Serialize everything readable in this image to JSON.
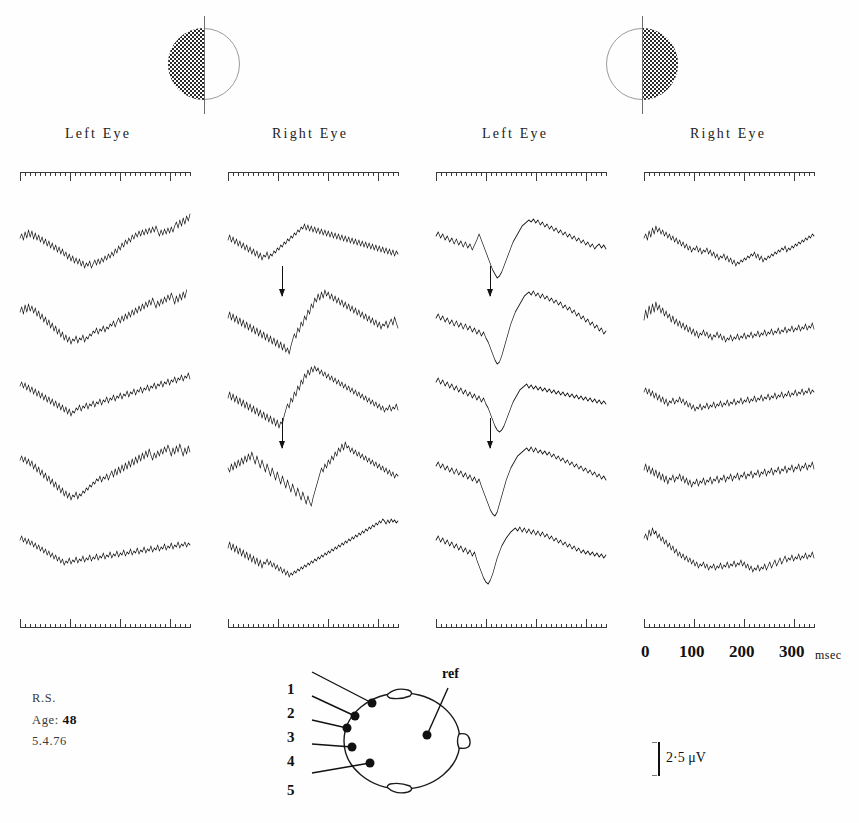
{
  "figure": {
    "subject": {
      "initials": "R.S.",
      "age_label": "Age:",
      "age_value": "48",
      "date": "5.4.76"
    },
    "calibration": {
      "label": "2·5 μV",
      "microvolts": 2.5
    },
    "time_axis": {
      "tick_labels": [
        "0",
        "100",
        "200",
        "300"
      ],
      "unit": "msec",
      "range_ms": [
        0,
        340
      ],
      "major_interval_ms": 100,
      "minor_interval_ms": 10
    },
    "stimuli": [
      {
        "name": "left-half-field-checkerboard",
        "shaded_half": "left"
      },
      {
        "name": "right-half-field-checkerboard",
        "shaded_half": "right"
      }
    ],
    "columns": [
      {
        "id": "c1",
        "label": "Left Eye",
        "stimulus": "left-half-field-checkerboard"
      },
      {
        "id": "c2",
        "label": "Right Eye",
        "stimulus": "left-half-field-checkerboard"
      },
      {
        "id": "c3",
        "label": "Left Eye",
        "stimulus": "right-half-field-checkerboard"
      },
      {
        "id": "c4",
        "label": "Right Eye",
        "stimulus": "right-half-field-checkerboard"
      }
    ],
    "electrodes": {
      "labels": [
        "1",
        "2",
        "3",
        "4",
        "5"
      ],
      "reference_label": "ref"
    }
  },
  "chart_data": {
    "type": "line",
    "xlabel": "msec",
    "ylabel": "μV",
    "xlim": [
      0,
      340
    ],
    "grid": false,
    "legend": "none",
    "n_columns": 4,
    "n_rows": 5,
    "row_electrodes": [
      "1",
      "2",
      "3",
      "4",
      "5"
    ],
    "annotations": [
      {
        "type": "arrow",
        "column": "c2",
        "row": 2,
        "points_to_ms": 108,
        "meaning": "major negative peak"
      },
      {
        "type": "arrow",
        "column": "c2",
        "row": 4,
        "points_to_ms": 108,
        "meaning": "major negative peak"
      },
      {
        "type": "arrow",
        "column": "c3",
        "row": 2,
        "points_to_ms": 108,
        "meaning": "major negative peak"
      },
      {
        "type": "arrow",
        "column": "c3",
        "row": 4,
        "points_to_ms": 108,
        "meaning": "major negative peak"
      }
    ],
    "series": [
      {
        "name": "c1-r1",
        "column": "c1",
        "row": 1,
        "d": "M0,24 L3,20 L6,26 L9,18 L12,24 L15,16 L18,23 L21,17 L24,25 L27,19 L30,26 L33,21 L36,28 L39,23 L42,30 L45,25 L48,32 L51,27 L54,34 L57,29 L60,36 L63,31 L66,38 L69,33 L72,40 L75,35 L78,42 L81,38 L84,45 L87,40 L90,47 L93,42 L96,49 L99,44 L102,50 L105,45 L108,52 L111,47 L114,54 L117,49 L120,52 L123,47 L126,54 L129,50 L132,46 L135,51 L138,45 L141,50 L144,44 L147,48 L150,42 L153,46 L156,40 L159,44 L162,38 L165,42 L168,35 L171,39 L174,32 L177,36 L180,29 L183,33 L186,26 L189,30 L192,24 L195,28 L198,21 L201,25 L204,19 L207,23 L210,17 L213,22 L216,16 L219,21 L222,15 L225,20 L228,14 L231,19 L234,13 L237,18 L240,12 L243,17 L246,22 L249,16 L252,21 L255,15 L258,20 L261,14 L264,19 L267,13 L270,18 L273,12 L276,8 L279,14 L282,6 L285,12 L288,4 L291,10 L294,2 L297,7 L300,0"
      },
      {
        "name": "c1-r2",
        "column": "c1",
        "row": 2,
        "d": "M0,22 L3,17 L6,24 L9,15 L12,22 L15,14 L18,21 L21,16 L24,23 L27,18 L30,26 L33,21 L36,29 L39,24 L42,32 L45,27 L48,35 L51,30 L54,38 L57,33 L60,41 L63,36 L66,44 L69,39 L72,47 L75,42 L78,50 L81,45 L84,52 L87,47 L90,54 L93,49 L96,51 L99,46 L102,53 L105,48 L108,50 L111,45 L114,52 L117,47 L120,49 L123,44 L126,46 L129,41 L132,43 L135,38 L138,44 L141,39 L144,41 L147,36 L150,42 L153,37 L156,39 L159,34 L162,36 L165,31 L168,37 L171,32 L174,28 L177,33 L180,26 L183,31 L186,24 L189,29 L192,22 L195,27 L198,20 L201,25 L204,18 L207,23 L210,16 L213,21 L216,14 L219,19 L222,12 L225,17 L228,10 L231,15 L234,8 L237,13 L240,18 L243,11 L246,16 L249,9 L252,14 L255,7 L258,12 L261,5 L264,10 L267,3 L270,8 L273,14 L276,6 L279,12 L282,4 L285,10 L288,2 L291,8 L294,0"
      },
      {
        "name": "c1-r3",
        "column": "c1",
        "row": 3,
        "d": "M0,20 L3,16 L6,22 L9,17 L12,24 L15,19 L18,26 L21,21 L24,28 L27,23 L30,30 L33,25 L36,32 L39,27 L42,34 L45,29 L48,36 L51,31 L54,38 L57,33 L60,40 L63,35 L66,42 L69,37 L72,44 L75,39 L78,46 L81,41 L84,48 L87,43 L90,50 L93,45 L96,47 L99,42 L102,44 L105,39 L108,45 L111,40 L114,42 L117,37 L120,43 L123,38 L126,40 L129,35 L132,41 L135,36 L138,38 L141,33 L144,39 L147,34 L150,36 L153,31 L156,37 L159,32 L162,34 L165,29 L168,35 L171,30 L174,32 L177,27 L180,33 L183,28 L186,30 L189,25 L192,31 L195,26 L198,28 L201,23 L204,29 L207,24 L210,26 L213,21 L216,27 L219,22 L222,24 L225,19 L228,25 L231,20 L234,22 L237,17 L240,23 L243,18 L246,20 L249,15 L252,21 L255,16 L258,18 L261,13 L264,19 L267,14 L270,16 L273,11 L276,17 L279,12 L282,14 L285,9 L288,15 L291,10 L294,12 L297,7 L300,13"
      },
      {
        "name": "c1-r4",
        "column": "c1",
        "row": 4,
        "d": "M0,18 L3,14 L6,20 L9,15 L12,22 L15,17 L18,24 L21,19 L24,27 L27,22 L30,30 L33,25 L36,33 L39,28 L42,36 L45,31 L48,39 L51,34 L54,42 L57,37 L60,45 L63,40 L66,48 L69,43 L72,51 L75,46 L78,54 L81,49 L84,56 L87,51 L90,58 L93,53 L96,55 L99,50 L102,57 L105,52 L108,54 L111,49 L114,51 L117,46 L120,48 L123,43 L126,45 L129,40 L132,42 L135,37 L138,39 L141,34 L144,40 L147,35 L150,37 L153,32 L156,38 L159,33 L162,29 L165,35 L168,27 L171,33 L174,25 L177,31 L180,23 L183,29 L186,21 L189,27 L192,19 L195,25 L198,17 L201,23 L204,15 L207,21 L210,13 L213,19 L216,11 L219,17 L222,9 L225,15 L228,7 L231,13 L234,18 L237,11 L240,16 L243,9 L246,14 L249,7 L252,12 L255,5 L258,10 L261,3 L264,8 L267,14 L270,6 L273,12 L276,4 L279,10 L282,2 L285,8 L288,14 L291,6 L294,12 L297,4 L300,10"
      },
      {
        "name": "c1-r5",
        "column": "c1",
        "row": 5,
        "d": "M0,22 L3,18 L6,24 L9,20 L12,26 L15,21 L18,27 L21,23 L24,29 L27,25 L30,31 L33,27 L36,33 L39,29 L42,35 L45,31 L48,37 L51,33 L54,39 L57,35 L60,41 L63,37 L66,43 L69,39 L72,45 L75,41 L78,47 L81,43 L84,45 L87,40 L90,46 L93,42 L96,44 L99,39 L102,45 L105,41 L108,43 L111,38 L114,44 L117,40 L120,42 L123,37 L126,43 L129,39 L132,41 L135,36 L138,42 L141,38 L144,40 L147,35 L150,41 L153,37 L156,39 L159,34 L162,40 L165,36 L168,38 L171,33 L174,39 L177,35 L180,37 L183,32 L186,38 L189,34 L192,36 L195,31 L198,37 L201,33 L204,35 L207,30 L210,36 L213,32 L216,34 L219,29 L222,35 L225,31 L228,33 L231,28 L234,34 L237,30 L240,32 L243,27 L246,33 L249,29 L252,31 L255,26 L258,32 L261,28 L264,30 L267,25 L270,31 L273,27 L276,29 L279,24 L282,30 L285,26 L288,28 L291,24 L294,29 L297,25 L300,27"
      },
      {
        "name": "c2-r1",
        "column": "c2",
        "row": 1,
        "d": "M0,26 L3,21 L6,28 L9,23 L12,30 L15,25 L18,32 L21,27 L24,34 L27,29 L30,36 L33,31 L36,38 L39,33 L42,40 L45,35 L48,42 L51,37 L54,44 L57,39 L60,46 L63,41 L66,43 L69,38 L72,45 L75,40 L78,42 L81,37 L84,39 L87,34 L90,36 L93,31 L96,33 L99,28 L102,30 L105,25 L108,27 L111,22 L114,24 L117,19 L120,21 L123,16 L126,18 L129,13 L132,15 L135,10 L138,16 L141,11 L144,17 L147,12 L150,18 L153,13 L156,19 L159,14 L162,20 L165,15 L168,21 L171,16 L174,22 L177,17 L180,23 L183,18 L186,24 L189,19 L192,25 L195,20 L198,26 L201,21 L204,27 L207,22 L210,28 L213,23 L216,29 L219,24 L222,30 L225,25 L228,31 L231,26 L234,32 L237,27 L240,33 L243,28 L246,34 L249,29 L252,35 L255,30 L258,36 L261,31 L264,37 L267,32 L270,38 L273,33 L276,39 L279,34 L282,40 L285,35 L288,41 L291,36 L294,42 L297,37 L300,40"
      },
      {
        "name": "c2-r2",
        "column": "c2",
        "row": 2,
        "d": "M0,28 L3,22 L6,30 L9,24 L12,32 L15,26 L18,34 L21,28 L24,36 L27,30 L30,38 L33,32 L36,40 L39,34 L42,42 L45,36 L48,44 L51,38 L54,46 L57,40 L60,48 L63,42 L66,50 L69,44 L72,52 L75,46 L78,54 L81,48 L84,56 L87,50 L90,58 L93,52 L96,60 L99,54 L102,62 L105,58 L108,64 L111,56 L114,50 L117,44 L120,48 L123,38 L126,42 L129,32 L132,36 L135,26 L138,30 L141,20 L144,24 L147,14 L150,18 L153,8 L156,12 L159,4 L162,10 L165,2 L168,8 L171,0 L174,6 L177,2 L180,9 L183,4 L186,11 L189,6 L192,13 L195,8 L198,15 L201,10 L204,17 L207,12 L210,19 L213,14 L216,21 L219,16 L222,23 L225,18 L228,25 L231,20 L234,27 L237,22 L240,29 L243,24 L246,31 L249,26 L252,33 L255,28 L258,35 L261,30 L264,37 L267,32 L270,39 L273,34 L276,36 L279,31 L282,38 L285,33 L288,29 L291,35 L294,27 L297,33 L300,38"
      },
      {
        "name": "c2-r3",
        "column": "c2",
        "row": 3,
        "d": "M0,32 L3,26 L6,34 L9,28 L12,36 L15,30 L18,38 L21,32 L24,40 L27,34 L30,42 L33,36 L36,44 L39,38 L42,46 L45,40 L48,48 L51,42 L54,50 L57,44 L60,52 L63,46 L66,54 L69,48 L72,56 L75,50 L78,58 L81,52 L84,60 L87,54 L90,62 L93,56 L96,58 L99,50 L102,44 L105,38 L108,42 L111,32 L114,36 L117,26 L120,30 L123,20 L126,24 L129,14 L132,18 L135,8 L138,12 L141,4 L144,9 L147,1 L150,6 L153,0 L156,5 L159,2 L162,8 L165,4 L168,10 L171,6 L174,12 L177,8 L180,14 L183,10 L186,16 L189,12 L192,18 L195,14 L198,20 L201,16 L204,22 L207,18 L210,24 L213,20 L216,26 L219,22 L222,28 L225,24 L228,30 L231,26 L234,32 L237,28 L240,34 L243,30 L246,36 L249,32 L252,38 L255,34 L258,40 L261,36 L264,42 L267,38 L270,44 L273,40 L276,46 L279,42 L282,44 L285,39 L288,45 L291,41 L294,43 L297,38 L300,44"
      },
      {
        "name": "c2-r4",
        "column": "c2",
        "row": 4,
        "d": "M0,26 L3,30 L6,22 L9,28 L12,20 L15,26 L18,18 L21,24 L24,16 L27,22 L30,14 L33,20 L36,12 L39,18 L42,10 L45,16 L48,22 L51,14 L54,20 L57,26 L60,18 L63,24 L66,30 L69,22 L72,28 L75,34 L78,26 L81,32 L84,38 L87,30 L90,36 L93,42 L96,34 L99,40 L102,46 L105,38 L108,44 L111,50 L114,42 L117,48 L120,54 L123,46 L126,52 L129,58 L132,50 L135,56 L138,62 L141,54 L144,60 L147,64 L150,56 L153,50 L156,44 L159,38 L162,32 L165,26 L168,30 L171,22 L174,26 L177,18 L180,22 L183,14 L186,18 L189,10 L192,14 L195,6 L198,10 L201,2 L204,8 L207,0 L210,6 L213,4 L216,10 L219,6 L222,12 L225,8 L228,14 L231,10 L234,16 L237,12 L240,18 L243,14 L246,20 L249,16 L252,22 L255,18 L258,24 L261,20 L264,26 L267,22 L270,28 L273,24 L276,30 L279,26 L282,32 L285,28 L288,34 L291,30 L294,36 L297,32 L300,34"
      },
      {
        "name": "c2-r5",
        "column": "c2",
        "row": 5,
        "d": "M0,30 L3,24 L6,32 L9,26 L12,34 L15,28 L18,36 L21,30 L24,38 L27,32 L30,40 L33,34 L36,42 L39,36 L42,44 L45,38 L48,46 L51,40 L54,48 L57,42 L60,50 L63,44 L66,46 L69,41 L72,47 L75,43 L78,49 L81,45 L84,51 L87,47 L90,53 L93,49 L96,55 L99,51 L102,57 L105,53 L108,59 L111,55 L114,57 L117,53 L120,55 L123,51 L126,53 L129,49 L132,51 L135,47 L138,49 L141,45 L144,47 L147,43 L150,45 L153,41 L156,43 L159,39 L162,41 L165,37 L168,39 L171,35 L174,37 L177,33 L180,35 L183,31 L186,33 L189,29 L192,31 L195,27 L198,29 L201,25 L204,27 L207,23 L210,25 L213,21 L216,23 L219,19 L222,21 L225,17 L228,19 L231,15 L234,17 L237,13 L240,15 L243,11 L246,13 L249,9 L252,11 L255,7 L258,9 L261,5 L264,7 L267,3 L270,5 L273,1 L276,3 L279,6 L282,2 L285,5 L288,1 L291,4 L294,2 L297,5 L300,3"
      },
      {
        "name": "c3-r1",
        "column": "c3",
        "row": 1,
        "d": "M0,22 L4,18 L8,24 L12,20 L16,26 L20,22 L24,28 L28,24 L32,30 L36,25 L40,31 L44,27 L48,33 L52,28 L56,34 L60,30 L64,36 L68,31 L72,26 L76,20 L80,26 L84,32 L88,38 L92,44 L96,50 L100,56 L104,60 L108,64 L112,62 L116,58 L120,52 L124,46 L128,40 L132,34 L136,28 L140,24 L144,20 L148,16 L152,12 L156,10 L160,8 L164,6 L168,8 L172,5 L176,9 L180,6 L184,11 L188,8 L192,13 L196,10 L200,15 L204,12 L208,17 L212,14 L216,19 L220,16 L224,21 L228,18 L232,23 L236,20 L240,25 L244,22 L248,27 L252,24 L256,29 L260,26 L264,31 L268,28 L272,33 L276,30 L280,35 L284,32 L288,30 L292,34 L296,31 L300,35"
      },
      {
        "name": "c3-r2",
        "column": "c3",
        "row": 2,
        "d": "M0,28 L4,24 L8,30 L12,26 L16,32 L20,28 L24,34 L28,30 L32,36 L36,31 L40,37 L44,33 L48,39 L52,34 L56,40 L60,36 L64,42 L68,38 L72,44 L76,40 L80,46 L84,42 L88,48 L92,52 L96,58 L100,64 L104,70 L108,74 L112,72 L116,66 L120,58 L124,50 L128,42 L132,34 L136,28 L140,22 L144,18 L148,14 L152,10 L156,6 L160,4 L164,2 L168,5 L172,1 L176,6 L180,3 L184,8 L188,4 L192,9 L196,6 L200,11 L204,8 L208,13 L212,10 L216,15 L220,12 L224,18 L228,15 L232,20 L236,17 L240,23 L244,20 L248,26 L252,23 L256,29 L260,26 L264,32 L268,29 L272,35 L276,32 L280,38 L284,35 L288,41 L292,38 L296,44 L300,41"
      },
      {
        "name": "c3-r3",
        "column": "c3",
        "row": 3,
        "d": "M0,16 L4,12 L8,18 L12,14 L16,20 L20,16 L24,22 L28,18 L32,24 L36,20 L40,26 L44,22 L48,28 L52,24 L56,30 L60,26 L64,32 L68,28 L72,34 L76,30 L80,36 L84,32 L88,38 L92,42 L96,48 L100,54 L104,60 L108,64 L112,66 L116,64 L120,60 L124,54 L128,48 L132,42 L136,36 L140,32 L144,28 L148,24 L152,22 L156,20 L160,18 L164,22 L168,19 L172,23 L176,20 L180,24 L184,21 L188,25 L192,22 L196,26 L200,23 L204,27 L208,24 L212,28 L216,25 L220,29 L224,26 L228,30 L232,27 L236,31 L240,28 L244,32 L248,29 L252,33 L256,30 L260,34 L264,31 L268,35 L272,32 L276,36 L280,33 L284,37 L288,34 L292,38 L296,35 L300,38"
      },
      {
        "name": "c3-r4",
        "column": "c3",
        "row": 4,
        "d": "M0,24 L4,20 L8,26 L12,22 L16,28 L20,24 L24,30 L28,26 L32,32 L36,27 L40,33 L44,29 L48,35 L52,31 L56,37 L60,33 L64,39 L68,35 L72,41 L76,37 L80,44 L84,50 L88,56 L92,62 L96,68 L100,72 L104,74 L108,70 L112,62 L116,54 L120,46 L124,38 L128,32 L132,26 L136,22 L140,18 L144,14 L148,12 L152,10 L156,8 L160,6 L164,9 L168,5 L172,10 L176,6 L180,11 L184,8 L188,12 L192,9 L196,13 L200,10 L204,15 L208,12 L212,17 L216,14 L220,19 L224,16 L228,21 L232,18 L236,23 L240,20 L244,25 L248,22 L252,27 L256,24 L260,29 L264,26 L268,31 L272,28 L276,33 L280,30 L284,35 L288,32 L292,37 L296,34 L300,38"
      },
      {
        "name": "c3-r5",
        "column": "c3",
        "row": 5,
        "d": "M0,22 L4,18 L8,24 L12,20 L16,26 L20,22 L24,28 L28,24 L32,30 L36,26 L40,32 L44,28 L48,34 L52,30 L56,36 L60,32 L64,38 L68,34 L72,42 L76,48 L80,54 L84,60 L88,64 L92,66 L96,62 L100,56 L104,48 L108,40 L112,34 L116,28 L120,24 L124,20 L128,17 L132,14 L136,12 L140,10 L144,13 L148,9 L152,14 L156,10 L160,15 L164,11 L168,16 L172,12 L176,17 L180,13 L184,18 L188,14 L192,19 L196,16 L200,21 L204,18 L208,23 L212,20 L216,25 L220,22 L224,27 L228,24 L232,29 L236,26 L240,31 L244,28 L248,33 L252,30 L256,35 L260,32 L264,36 L268,33 L272,37 L276,34 L280,38 L284,35 L288,39 L292,36 L296,40 L300,37"
      },
      {
        "name": "c4-r1",
        "column": "c4",
        "row": 1,
        "d": "M0,24 L3,20 L6,26 L9,17 L12,23 L15,14 L18,20 L21,12 L24,18 L27,14 L30,20 L33,16 L36,22 L39,18 L42,24 L45,20 L48,26 L51,22 L54,28 L57,24 L60,30 L63,26 L66,32 L69,28 L72,34 L75,30 L78,36 L81,32 L84,38 L87,34 L90,36 L93,32 L96,38 L99,34 L102,40 L105,36 L108,38 L111,34 L114,40 L117,36 L120,42 L123,38 L126,44 L129,40 L132,46 L135,42 L138,44 L141,40 L144,46 L147,42 L150,48 L153,44 L156,50 L159,46 L162,52 L165,48 L168,50 L171,46 L174,48 L177,44 L180,46 L183,42 L186,44 L189,40 L192,42 L195,38 L198,44 L201,40 L204,46 L207,42 L210,48 L213,44 L216,46 L219,42 L222,44 L225,40 L228,42 L231,38 L234,40 L237,36 L240,38 L243,34 L246,36 L249,32 L252,38 L255,34 L258,36 L261,32 L264,34 L267,30 L270,32 L273,28 L276,30 L279,26 L282,28 L285,24 L288,26 L291,22 L294,24 L297,20 L300,22"
      },
      {
        "name": "c4-r2",
        "column": "c4",
        "row": 2,
        "d": "M0,30 L3,20 L6,28 L9,16 L12,24 L15,14 L18,22 L21,12 L24,20 L27,15 L30,23 L33,18 L36,26 L39,21 L42,28 L45,24 L48,32 L51,26 L54,34 L57,29 L60,36 L63,31 L66,38 L69,33 L72,40 L75,35 L78,42 L81,37 L84,44 L87,39 L90,46 L93,41 L96,48 L99,43 L102,45 L105,40 L108,46 L111,42 L114,48 L117,44 L120,50 L123,45 L126,47 L129,42 L132,48 L135,44 L138,50 L141,46 L144,52 L147,48 L150,50 L153,45 L156,51 L159,47 L162,49 L165,44 L168,50 L171,46 L174,48 L177,43 L180,49 L183,45 L186,47 L189,42 L192,48 L195,44 L198,46 L201,41 L204,47 L207,43 L210,45 L213,40 L216,46 L219,42 L222,44 L225,39 L228,45 L231,41 L234,43 L237,38 L240,44 L243,40 L246,42 L249,37 L252,43 L255,39 L258,41 L261,36 L264,42 L267,38 L270,40 L273,35 L276,41 L279,37 L282,39 L285,34 L288,40 L291,36 L294,38 L297,33 L300,39"
      },
      {
        "name": "c4-r3",
        "column": "c4",
        "row": 3,
        "d": "M0,26 L3,22 L6,28 L9,23 L12,30 L15,25 L18,32 L21,27 L24,34 L27,29 L30,36 L33,31 L36,38 L39,33 L42,40 L45,35 L48,37 L51,32 L54,38 L57,34 L60,36 L63,31 L66,37 L69,33 L72,39 L75,35 L78,41 L81,37 L84,43 L87,39 L90,45 L93,41 L96,43 L99,38 L102,44 L105,40 L108,42 L111,37 L114,43 L117,39 L120,41 L123,36 L126,42 L129,38 L132,40 L135,35 L138,41 L141,37 L144,39 L147,34 L150,40 L153,36 L156,38 L159,33 L162,39 L165,35 L168,37 L171,32 L174,38 L177,34 L180,36 L183,31 L186,37 L189,33 L192,35 L195,30 L198,36 L201,32 L204,34 L207,29 L210,35 L213,31 L216,33 L219,28 L222,34 L225,30 L228,32 L231,27 L234,33 L237,29 L240,31 L243,26 L246,32 L249,28 L252,30 L255,25 L258,31 L261,27 L264,29 L267,24 L270,30 L273,26 L276,28 L279,23 L282,29 L285,25 L288,27 L291,22 L294,28 L297,24 L300,26"
      },
      {
        "name": "c4-r4",
        "column": "c4",
        "row": 4,
        "d": "M0,28 L3,22 L6,30 L9,24 L12,32 L15,26 L18,34 L21,28 L24,36 L27,30 L30,38 L33,32 L36,40 L39,34 L42,42 L45,36 L48,38 L51,33 L54,40 L57,35 L60,37 L63,32 L66,39 L69,34 L72,41 L75,36 L78,43 L81,38 L84,45 L87,40 L90,42 L93,37 L96,44 L99,39 L102,41 L105,36 L108,43 L111,38 L114,40 L117,35 L120,42 L123,37 L126,39 L129,34 L132,41 L135,36 L138,38 L141,33 L144,40 L147,35 L150,37 L153,32 L156,39 L159,34 L162,36 L165,31 L168,38 L171,33 L174,35 L177,30 L180,37 L183,32 L186,34 L189,29 L192,36 L195,31 L198,33 L201,28 L204,35 L207,30 L210,32 L213,27 L216,34 L219,29 L222,31 L225,26 L228,33 L231,28 L234,30 L237,25 L240,32 L243,27 L246,29 L249,24 L252,31 L255,26 L258,28 L261,23 L264,30 L267,25 L270,27 L273,22 L276,29 L279,24 L282,26 L285,21 L288,28 L291,23 L294,25 L297,20 L300,27"
      },
      {
        "name": "c4-r5",
        "column": "c4",
        "row": 5,
        "d": "M0,20 L3,16 L6,22 L9,12 L12,18 L15,10 L18,16 L21,13 L24,20 L27,16 L30,23 L33,19 L36,26 L39,22 L42,29 L45,25 L48,32 L51,28 L54,35 L57,31 L60,38 L63,34 L66,40 L69,36 L72,42 L75,38 L78,44 L81,40 L84,46 L87,42 L90,48 L93,44 L96,50 L99,46 L102,48 L105,44 L108,50 L111,46 L114,52 L117,48 L120,50 L123,46 L126,52 L129,48 L132,50 L135,45 L138,51 L141,47 L144,49 L147,44 L150,50 L153,46 L156,48 L159,43 L162,49 L165,45 L168,47 L171,42 L174,48 L177,44 L180,50 L183,46 L186,52 L189,48 L192,54 L195,50 L198,52 L201,47 L204,53 L207,49 L210,51 L213,46 L216,52 L219,48 L222,44 L225,50 L228,46 L231,42 L234,48 L237,44 L240,40 L243,46 L246,42 L249,38 L252,44 L255,40 L258,42 L261,37 L264,43 L267,39 L270,41 L273,36 L276,42 L279,38 L282,40 L285,35 L288,41 L291,37 L294,39 L297,34 L300,40"
      }
    ]
  }
}
